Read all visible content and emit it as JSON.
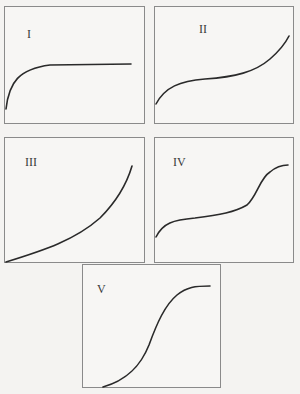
{
  "panels": [
    {
      "id": "I",
      "label": "I",
      "curve_shape": "rapid rise then plateau (saturating)"
    },
    {
      "id": "II",
      "label": "II",
      "curve_shape": "rise, flatten, then rise steeply (cubic)"
    },
    {
      "id": "III",
      "label": "III",
      "curve_shape": "slow then accelerating rise (exponential-like)"
    },
    {
      "id": "IV",
      "label": "IV",
      "curve_shape": "rise, gentle slope, steep rise, then plateau"
    },
    {
      "id": "V",
      "label": "V",
      "curve_shape": "sigmoid (S-shaped)"
    }
  ]
}
